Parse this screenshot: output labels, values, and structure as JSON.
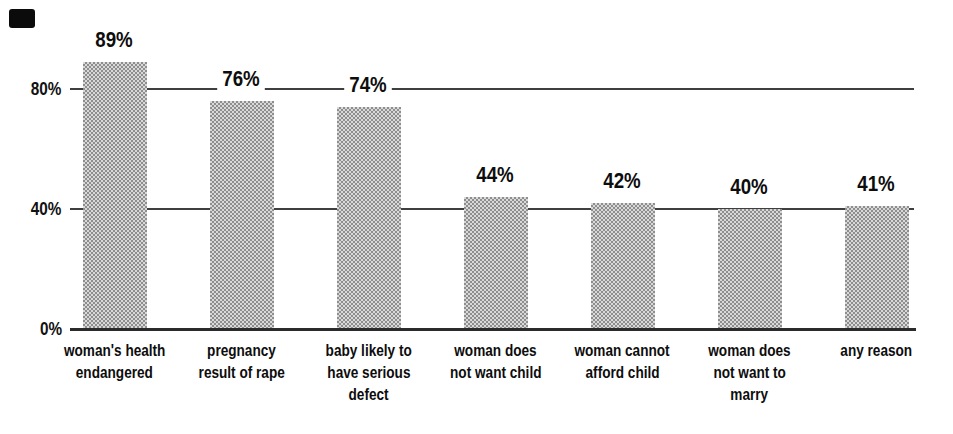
{
  "figure": {
    "scan_mark": "black-rectangle-top-left",
    "background_color": "#ffffff",
    "text_color": "#0d0d0d",
    "gridline_color": "#3f3f3f",
    "bar_fill_light": "#d9d9d9",
    "bar_fill_dark": "#8e8e8e",
    "bar_texture": "halftone-checker"
  },
  "chart_data": {
    "type": "bar",
    "title": "",
    "categories": [
      "woman's health endangered",
      "pregnancy result of rape",
      "baby likely to have serious defect",
      "woman does not want child",
      "woman cannot afford child",
      "woman does not want to marry",
      "any reason"
    ],
    "category_lines": [
      [
        "woman's health",
        "endangered"
      ],
      [
        "pregnancy",
        "result of rape"
      ],
      [
        "baby likely to",
        "have serious",
        "defect"
      ],
      [
        "woman does",
        "not want child"
      ],
      [
        "woman cannot",
        "afford child"
      ],
      [
        "woman does",
        "not want to",
        "marry"
      ],
      [
        "any reason"
      ]
    ],
    "values": [
      89,
      76,
      74,
      44,
      42,
      40,
      41
    ],
    "value_labels": [
      "89%",
      "76%",
      "74%",
      "44%",
      "42%",
      "40%",
      "41%"
    ],
    "yticks": [
      {
        "label": "80%",
        "value": 80
      },
      {
        "label": "40%",
        "value": 40
      },
      {
        "label": "0%",
        "value": 0
      }
    ],
    "ylim": [
      0,
      100
    ],
    "gridlines": [
      80,
      40
    ],
    "grid": "horizontal",
    "legend": "none",
    "xlabel": "",
    "ylabel": ""
  }
}
